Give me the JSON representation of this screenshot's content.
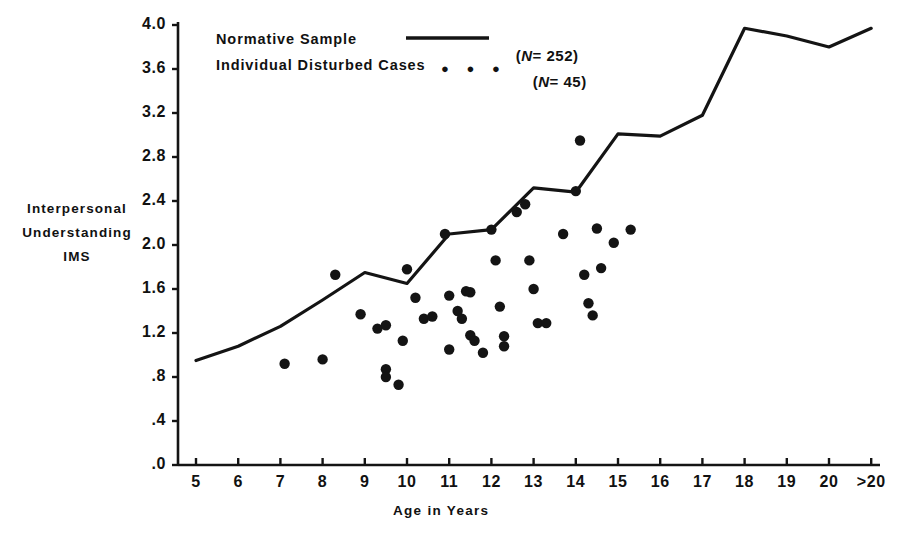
{
  "figure": {
    "x_axis_title": "Age in Years",
    "y_axis_title_lines": [
      "Interpersonal",
      "Understanding",
      "IMS"
    ]
  },
  "legend": {
    "entries": [
      {
        "label": "Normative Sample",
        "marker": "line",
        "n_text": "(N= 252)",
        "n_prefix": "(",
        "n_italic": "N",
        "n_value": "= 252)"
      },
      {
        "label": "Individual Disturbed Cases",
        "marker": "dots",
        "dots": "● ● ●",
        "n_text": "(N= 45)",
        "n_prefix": "(",
        "n_italic": "N",
        "n_value": "= 45)"
      }
    ]
  },
  "chart_data": {
    "type": "line",
    "title": "",
    "xlabel": "Age in Years",
    "ylabel": "Interpersonal Understanding IMS",
    "grid": false,
    "legend_position": "top-left-inside",
    "xlim": [
      5,
      21
    ],
    "ylim": [
      0.0,
      4.0
    ],
    "x_tick_labels": [
      "5",
      "6",
      "7",
      "8",
      "9",
      "10",
      "11",
      "12",
      "13",
      "14",
      "15",
      "16",
      "17",
      "18",
      "19",
      "20",
      ">20"
    ],
    "y_tick_labels": [
      "4.0",
      "3.6",
      "3.2",
      "2.8",
      "2.4",
      "2.0",
      "1.6",
      "1.2",
      ".8",
      ".4",
      ".0"
    ],
    "y_tick_values": [
      4.0,
      3.6,
      3.2,
      2.8,
      2.4,
      2.0,
      1.6,
      1.2,
      0.8,
      0.4,
      0.0
    ],
    "series": [
      {
        "name": "Normative Sample",
        "type": "line",
        "n": 252,
        "x": [
          5,
          6,
          7,
          8,
          9,
          10,
          11,
          12,
          13,
          14,
          15,
          16,
          17,
          18,
          19,
          20,
          21
        ],
        "y": [
          0.95,
          1.08,
          1.26,
          1.5,
          1.75,
          1.65,
          2.1,
          2.14,
          2.52,
          2.48,
          3.01,
          2.99,
          3.18,
          3.97,
          3.9,
          3.8,
          3.97
        ]
      },
      {
        "name": "Individual Disturbed Cases",
        "type": "scatter",
        "n": 45,
        "points": [
          [
            7.1,
            0.92
          ],
          [
            8.0,
            0.96
          ],
          [
            8.3,
            1.73
          ],
          [
            8.9,
            1.37
          ],
          [
            9.3,
            1.24
          ],
          [
            9.5,
            1.27
          ],
          [
            9.5,
            0.87
          ],
          [
            9.5,
            0.8
          ],
          [
            9.8,
            0.73
          ],
          [
            9.9,
            1.13
          ],
          [
            10.0,
            1.78
          ],
          [
            10.2,
            1.52
          ],
          [
            10.4,
            1.33
          ],
          [
            10.9,
            2.1
          ],
          [
            11.0,
            1.54
          ],
          [
            11.0,
            1.05
          ],
          [
            11.2,
            1.4
          ],
          [
            11.3,
            1.33
          ],
          [
            11.4,
            1.58
          ],
          [
            11.5,
            1.57
          ],
          [
            11.5,
            1.18
          ],
          [
            11.6,
            1.13
          ],
          [
            11.8,
            1.02
          ],
          [
            12.0,
            2.14
          ],
          [
            12.1,
            1.86
          ],
          [
            12.2,
            1.44
          ],
          [
            12.3,
            1.17
          ],
          [
            12.3,
            1.08
          ],
          [
            12.6,
            2.3
          ],
          [
            12.8,
            2.37
          ],
          [
            12.9,
            1.86
          ],
          [
            13.0,
            1.6
          ],
          [
            13.1,
            1.29
          ],
          [
            13.7,
            2.1
          ],
          [
            14.0,
            2.49
          ],
          [
            14.1,
            2.95
          ],
          [
            14.2,
            1.73
          ],
          [
            14.3,
            1.47
          ],
          [
            14.4,
            1.36
          ],
          [
            14.5,
            2.15
          ],
          [
            14.6,
            1.79
          ],
          [
            14.9,
            2.02
          ],
          [
            15.3,
            2.14
          ],
          [
            10.6,
            1.35
          ],
          [
            13.3,
            1.29
          ]
        ]
      }
    ]
  },
  "geometry": {
    "plot_left": 178,
    "plot_right": 880,
    "plot_top": 22,
    "plot_bottom": 465,
    "x_first_tick_px": 196,
    "x_tick_step_px": 42.2,
    "y_zero_px": 465,
    "y_per_unit_px": 110.0,
    "dot_radius": 5.2,
    "line_width": 3.2,
    "stroke_color": "#141414"
  }
}
